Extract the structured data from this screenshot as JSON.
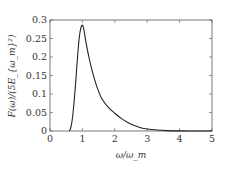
{
  "chart_data": {
    "type": "line",
    "title": "",
    "xlabel": "ω/ω_m",
    "ylabel": "F(ω)/(5E_{ω_m}²)",
    "xlim": [
      0,
      5
    ],
    "ylim": [
      0,
      0.3
    ],
    "xticks": [
      0,
      1,
      2,
      3,
      4,
      5
    ],
    "xtick_labels": [
      "0",
      "1",
      "2",
      "3",
      "4",
      "5"
    ],
    "yticks": [
      0,
      0.05,
      0.1,
      0.15,
      0.2,
      0.25,
      0.3
    ],
    "ytick_labels": [
      "0",
      "0.05",
      "0.1",
      "0.15",
      "0.2",
      "0.25",
      "0.3"
    ],
    "grid": false,
    "legend": null,
    "series": [
      {
        "name": "F(ω)",
        "color": "#222222",
        "x": [
          0.6,
          0.65,
          0.7,
          0.75,
          0.8,
          0.85,
          0.9,
          0.95,
          1.0,
          1.05,
          1.1,
          1.2,
          1.3,
          1.4,
          1.5,
          1.6,
          1.8,
          2.0,
          2.2,
          2.4,
          2.6,
          2.8,
          3.0,
          3.3,
          3.6,
          4.0,
          4.5,
          5.0
        ],
        "y": [
          0.0,
          0.012,
          0.04,
          0.085,
          0.14,
          0.2,
          0.25,
          0.278,
          0.286,
          0.272,
          0.245,
          0.2,
          0.163,
          0.132,
          0.107,
          0.087,
          0.064,
          0.048,
          0.034,
          0.023,
          0.015,
          0.009,
          0.0055,
          0.0025,
          0.0011,
          0.0003,
          0.0001,
          0.0
        ]
      }
    ]
  }
}
